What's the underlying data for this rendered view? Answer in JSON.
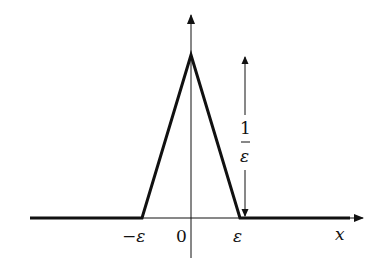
{
  "figure": {
    "labels": {
      "neg_eps": "−ε",
      "origin": "0",
      "eps": "ε",
      "x_axis": "x",
      "height_num": "1",
      "height_den": "ε"
    },
    "shape": {
      "type": "triangle",
      "base_left": "-ε",
      "base_right": "ε",
      "peak_x": 0,
      "peak_height": "1/ε"
    },
    "colors": {
      "line": "#111111",
      "background": "#ffffff"
    }
  }
}
